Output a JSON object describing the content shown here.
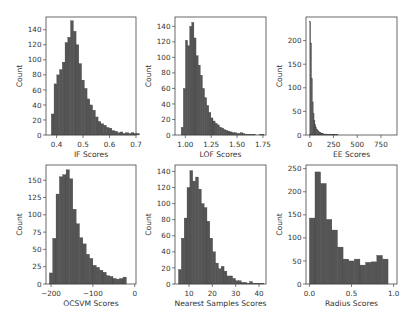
{
  "figure": {
    "bar_color": "#555555",
    "bar_edge": "#3a3a3a",
    "frame_color": "#444444"
  },
  "chart_data": [
    {
      "type": "bar",
      "title": "",
      "xlabel": "IF Scores",
      "ylabel": "Count",
      "xlim": [
        0.36,
        0.7
      ],
      "ylim": [
        0,
        157
      ],
      "xticks": [
        0.4,
        0.5,
        0.6,
        0.7
      ],
      "xtick_labels": [
        "0.4",
        "0.5",
        "0.6",
        "0.7"
      ],
      "yticks": [
        0,
        20,
        40,
        60,
        80,
        100,
        120,
        140
      ],
      "bin_start": 0.38,
      "bin_width": 0.0104,
      "values": [
        28,
        68,
        80,
        87,
        97,
        123,
        130,
        152,
        138,
        120,
        95,
        73,
        62,
        48,
        40,
        33,
        24,
        18,
        15,
        13,
        10,
        9,
        6,
        5,
        3,
        4,
        2,
        3,
        2,
        3,
        2,
        2
      ],
      "grid": false,
      "box": [
        46,
        17,
        136,
        135
      ]
    },
    {
      "type": "bar",
      "title": "",
      "xlabel": "LOF Scores",
      "ylabel": "Count",
      "xlim": [
        0.9,
        1.78
      ],
      "ylim": [
        0,
        152
      ],
      "xticks": [
        1.0,
        1.25,
        1.5,
        1.75
      ],
      "xtick_labels": [
        "1.00",
        "1.25",
        "1.50",
        "1.75"
      ],
      "yticks": [
        0,
        20,
        40,
        60,
        80,
        100,
        120,
        140
      ],
      "bin_start": 0.96,
      "bin_width": 0.0205,
      "values": [
        10,
        60,
        122,
        115,
        140,
        145,
        125,
        102,
        90,
        77,
        60,
        48,
        38,
        29,
        22,
        18,
        15,
        13,
        10,
        9,
        7,
        6,
        5,
        4,
        3,
        3,
        2,
        2,
        3,
        2,
        1,
        1,
        1,
        1,
        1,
        0,
        0,
        1,
        1
      ],
      "grid": false,
      "box": [
        175,
        17,
        266,
        135
      ]
    },
    {
      "type": "bar",
      "title": "",
      "xlabel": "EE Scores",
      "ylabel": "Count",
      "xlim": [
        -40,
        920
      ],
      "ylim": [
        0,
        250
      ],
      "xticks": [
        0,
        250,
        500,
        750
      ],
      "xtick_labels": [
        "0",
        "250",
        "500",
        "750"
      ],
      "yticks": [
        0,
        50,
        100,
        150,
        200
      ],
      "bin_start": 0,
      "bin_width": 9,
      "values": [
        240,
        195,
        120,
        70,
        45,
        30,
        22,
        16,
        12,
        9,
        7,
        6,
        5,
        4,
        3,
        3,
        2,
        2,
        2,
        2,
        1,
        1,
        1,
        1,
        1,
        1,
        1,
        1,
        1,
        1,
        1,
        1,
        1
      ],
      "grid": false,
      "box": [
        306,
        17,
        397,
        135
      ]
    },
    {
      "type": "bar",
      "title": "",
      "xlabel": "OCSVM Scores",
      "ylabel": "Count",
      "xlim": [
        -212,
        3
      ],
      "ylim": [
        0,
        172
      ],
      "xticks": [
        -200,
        -100,
        0
      ],
      "xtick_labels": [
        "−200",
        "−100",
        "0"
      ],
      "yticks": [
        0,
        25,
        50,
        75,
        100,
        125,
        150
      ],
      "bin_start": -204,
      "bin_width": 8,
      "values": [
        16,
        66,
        130,
        155,
        158,
        165,
        152,
        108,
        87,
        67,
        58,
        43,
        37,
        27,
        24,
        20,
        17,
        12,
        11,
        8,
        7,
        8,
        10
      ],
      "grid": false,
      "box": [
        46,
        165,
        136,
        284
      ]
    },
    {
      "type": "bar",
      "title": "",
      "xlabel": "Nearest Samples Scores",
      "ylabel": "Count",
      "xlim": [
        4,
        43
      ],
      "ylim": [
        0,
        148
      ],
      "xticks": [
        10,
        20,
        30,
        40
      ],
      "xtick_labels": [
        "10",
        "20",
        "30",
        "40"
      ],
      "yticks": [
        0,
        20,
        40,
        60,
        80,
        100,
        120,
        140
      ],
      "bin_start": 5.5,
      "bin_width": 1.22,
      "values": [
        18,
        57,
        82,
        120,
        141,
        128,
        133,
        118,
        100,
        95,
        78,
        57,
        40,
        26,
        19,
        22,
        16,
        10,
        10,
        7,
        4,
        4,
        2,
        2,
        1,
        3,
        1,
        1,
        1,
        1
      ],
      "grid": false,
      "box": [
        175,
        165,
        266,
        284
      ]
    },
    {
      "type": "bar",
      "title": "",
      "xlabel": "Radius Scores",
      "ylabel": "Count",
      "xlim": [
        -0.04,
        1.04
      ],
      "ylim": [
        0,
        258
      ],
      "xticks": [
        0.0,
        0.5,
        1.0
      ],
      "xtick_labels": [
        "0.0",
        "0.5",
        "1.0"
      ],
      "yticks": [
        0,
        50,
        100,
        150,
        200,
        250
      ],
      "bin_start": 0.0,
      "bin_width": 0.0667,
      "values": [
        143,
        243,
        218,
        140,
        117,
        80,
        54,
        50,
        54,
        41,
        47,
        48,
        62,
        54
      ],
      "grid": false,
      "box": [
        306,
        165,
        397,
        284
      ]
    }
  ]
}
